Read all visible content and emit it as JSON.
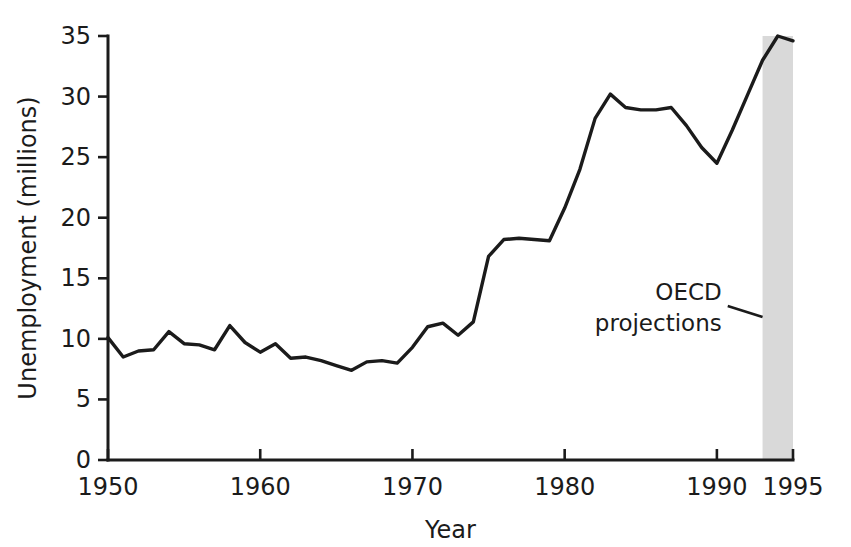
{
  "figure": {
    "name": "oecd-unemployment-line-chart",
    "background_color": "#ffffff",
    "line_color": "#1b1b1b",
    "shade_color": "#d9d9d9"
  },
  "chart_data": {
    "type": "line",
    "title": "",
    "subtitle": "",
    "xlabel": "Year",
    "ylabel": "Unemployment (millions)",
    "xlim": [
      1950,
      1995
    ],
    "ylim": [
      0,
      35
    ],
    "grid": false,
    "legend_position": "none",
    "x_ticks": [
      1950,
      1960,
      1970,
      1980,
      1990,
      1995
    ],
    "x_tick_labels": [
      "1950",
      "1960",
      "1970",
      "1980",
      "1990",
      "1995"
    ],
    "y_ticks": [
      0,
      5,
      10,
      15,
      20,
      25,
      30,
      35
    ],
    "y_tick_labels": [
      "0",
      "5",
      "10",
      "15",
      "20",
      "25",
      "30",
      "35"
    ],
    "series": [
      {
        "name": "Unemployment",
        "x": [
          1950,
          1951,
          1952,
          1953,
          1954,
          1955,
          1956,
          1957,
          1958,
          1959,
          1960,
          1961,
          1962,
          1963,
          1964,
          1965,
          1966,
          1967,
          1968,
          1969,
          1970,
          1971,
          1972,
          1973,
          1974,
          1975,
          1976,
          1977,
          1978,
          1979,
          1980,
          1981,
          1982,
          1983,
          1984,
          1985,
          1986,
          1987,
          1988,
          1989,
          1990,
          1991,
          1992,
          1993,
          1994,
          1995
        ],
        "values": [
          10.1,
          8.5,
          9.0,
          9.1,
          10.6,
          9.6,
          9.5,
          9.1,
          11.1,
          9.7,
          8.9,
          9.6,
          8.4,
          8.5,
          8.2,
          7.8,
          7.4,
          8.1,
          8.2,
          8.0,
          9.3,
          11.0,
          11.3,
          10.3,
          11.4,
          16.8,
          18.2,
          18.3,
          18.2,
          18.1,
          20.8,
          24.0,
          28.2,
          30.2,
          29.1,
          28.9,
          28.9,
          29.1,
          27.6,
          25.8,
          24.5,
          27.2,
          30.1,
          33.0,
          35.0,
          34.6
        ]
      }
    ],
    "shaded_region": {
      "label": "OECD projections",
      "x_start": 1993,
      "x_end": 1995,
      "color": "#d9d9d9"
    },
    "annotations": [
      {
        "text_line_1": "OECD",
        "text_line_2": "projections",
        "x": 1991.5,
        "y": 13.2,
        "points_to_x": 1993,
        "points_to_y": 11.8
      }
    ]
  }
}
